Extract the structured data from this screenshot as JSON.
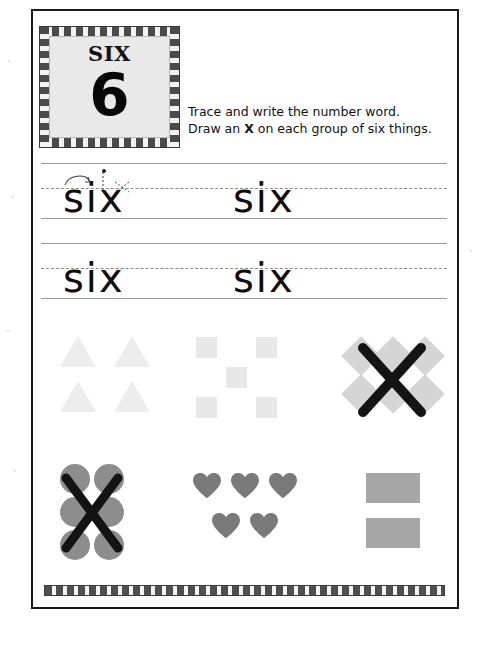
{
  "worksheet": {
    "title": "Number word worksheet - six",
    "number_card": {
      "word": "SIX",
      "digit": "6"
    },
    "instructions": {
      "line1": "Trace and write the number word.",
      "line2_before": "Draw an ",
      "line2_bold": "X",
      "line2_after": " on each group of six things."
    },
    "writing_rows": [
      {
        "row": 1,
        "words": [
          {
            "text": "six",
            "mode": "trace",
            "has_stroke_guides": true
          },
          {
            "text": "six",
            "mode": "trace",
            "has_stroke_guides": false
          }
        ]
      },
      {
        "row": 2,
        "words": [
          {
            "text": "six",
            "mode": "trace",
            "has_stroke_guides": false
          },
          {
            "text": "six",
            "mode": "trace",
            "has_stroke_guides": false
          }
        ]
      }
    ],
    "shape_groups": [
      {
        "id": "triangles",
        "shape": "triangle",
        "count": 4,
        "color": "#ededed",
        "marked_with_x": false,
        "is_six": false
      },
      {
        "id": "squares",
        "shape": "square",
        "count": 5,
        "color": "#e8e8e8",
        "marked_with_x": false,
        "is_six": false
      },
      {
        "id": "diamonds",
        "shape": "diamond",
        "count": 6,
        "color": "#d5d5d5",
        "marked_with_x": true,
        "is_six": true
      },
      {
        "id": "circles",
        "shape": "circle",
        "count": 6,
        "color": "#8d8d8d",
        "marked_with_x": true,
        "is_six": true
      },
      {
        "id": "hearts",
        "shape": "heart",
        "count": 5,
        "color": "#7a7a7a",
        "marked_with_x": false,
        "is_six": false
      },
      {
        "id": "rectangles",
        "shape": "rectangle",
        "count": 2,
        "color": "#a6a6a6",
        "marked_with_x": false,
        "is_six": false
      }
    ],
    "decoration": {
      "card_border_style": "checkered",
      "bottom_border_style": "checkered",
      "ink_color": "#1b1b1b"
    }
  }
}
